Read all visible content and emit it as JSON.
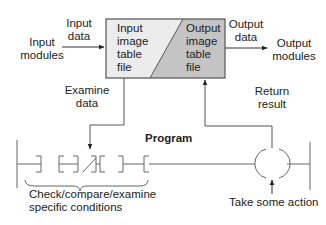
{
  "diagram": {
    "type": "plc-scan-diagram",
    "colors": {
      "input_table_fill": "#ececec",
      "output_table_fill": "#c4c4c4",
      "line": "#555555",
      "text": "#222222"
    },
    "labels": {
      "input_modules": [
        "Input",
        "modules"
      ],
      "input_data": [
        "Input",
        "data"
      ],
      "input_table": [
        "Input",
        "image",
        "table",
        "file"
      ],
      "output_table": [
        "Output",
        "image",
        "table",
        "file"
      ],
      "output_data": [
        "Output",
        "data"
      ],
      "output_modules": [
        "Output",
        "modules"
      ],
      "examine_data": [
        "Examine",
        "data"
      ],
      "return_result": [
        "Return",
        "result"
      ],
      "program": "Program",
      "check_conditions": [
        "Check/compare/examine",
        "specific conditions"
      ],
      "take_action": "Take some action"
    },
    "ladder_rung": {
      "contacts": [
        {
          "type": "normally-open"
        },
        {
          "type": "normally-closed"
        },
        {
          "type": "normally-open"
        }
      ],
      "coil": {
        "type": "output-coil"
      }
    }
  }
}
